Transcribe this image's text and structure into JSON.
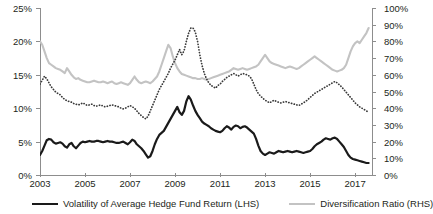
{
  "chart_data": {
    "type": "line",
    "title": "",
    "xlabel": "",
    "ylabel": "",
    "grid": false,
    "legend_position": "bottom",
    "x_ticks": [
      "2003",
      "2005",
      "2007",
      "2009",
      "2011",
      "2013",
      "2015",
      "2017"
    ],
    "x_range": [
      2003,
      2017.75
    ],
    "left_axis": {
      "label": "",
      "ylim": [
        0,
        25
      ],
      "unit": "%",
      "ticks": [
        "0%",
        "5%",
        "10%",
        "15%",
        "20%",
        "25%"
      ],
      "tick_values": [
        0,
        5,
        10,
        15,
        20,
        25
      ]
    },
    "right_axis": {
      "label": "",
      "ylim": [
        0,
        100
      ],
      "unit": "%",
      "ticks": [
        "0%",
        "10%",
        "20%",
        "30%",
        "40%",
        "50%",
        "60%",
        "70%",
        "80%",
        "90%",
        "100%"
      ],
      "tick_values": [
        0,
        10,
        20,
        30,
        40,
        50,
        60,
        70,
        80,
        90,
        100
      ]
    },
    "series": [
      {
        "name": "Volatility of Average Hedge Fund Return (LHS)",
        "axis": "left",
        "style": "solid",
        "color": "#1a1a1a",
        "x": [
          2003.0,
          2003.1,
          2003.2,
          2003.3,
          2003.4,
          2003.5,
          2003.6,
          2003.7,
          2003.8,
          2003.9,
          2004.0,
          2004.1,
          2004.2,
          2004.3,
          2004.4,
          2004.5,
          2004.6,
          2004.7,
          2004.8,
          2004.9,
          2005.0,
          2005.1,
          2005.2,
          2005.3,
          2005.4,
          2005.5,
          2005.6,
          2005.7,
          2005.8,
          2005.9,
          2006.0,
          2006.1,
          2006.2,
          2006.3,
          2006.4,
          2006.5,
          2006.6,
          2006.7,
          2006.8,
          2006.9,
          2007.0,
          2007.1,
          2007.2,
          2007.3,
          2007.4,
          2007.5,
          2007.6,
          2007.7,
          2007.8,
          2007.9,
          2008.0,
          2008.1,
          2008.2,
          2008.3,
          2008.4,
          2008.5,
          2008.6,
          2008.7,
          2008.8,
          2008.9,
          2009.0,
          2009.1,
          2009.2,
          2009.3,
          2009.4,
          2009.5,
          2009.6,
          2009.7,
          2009.8,
          2009.9,
          2010.0,
          2010.1,
          2010.2,
          2010.3,
          2010.4,
          2010.5,
          2010.6,
          2010.7,
          2010.8,
          2010.9,
          2011.0,
          2011.1,
          2011.2,
          2011.3,
          2011.4,
          2011.5,
          2011.6,
          2011.7,
          2011.8,
          2011.9,
          2012.0,
          2012.1,
          2012.2,
          2012.3,
          2012.4,
          2012.5,
          2012.6,
          2012.7,
          2012.8,
          2012.9,
          2013.0,
          2013.1,
          2013.2,
          2013.3,
          2013.4,
          2013.5,
          2013.6,
          2013.7,
          2013.8,
          2013.9,
          2014.0,
          2014.1,
          2014.2,
          2014.3,
          2014.4,
          2014.5,
          2014.6,
          2014.7,
          2014.8,
          2014.9,
          2015.0,
          2015.1,
          2015.2,
          2015.3,
          2015.4,
          2015.5,
          2015.6,
          2015.7,
          2015.8,
          2015.9,
          2016.0,
          2016.1,
          2016.2,
          2016.3,
          2016.4,
          2016.5,
          2016.6,
          2016.7,
          2016.8,
          2016.9,
          2017.0,
          2017.1,
          2017.2,
          2017.3,
          2017.4,
          2017.5,
          2017.6
        ],
        "y": [
          3.0,
          3.6,
          4.4,
          5.2,
          5.4,
          5.3,
          4.9,
          4.7,
          4.8,
          4.9,
          4.7,
          4.3,
          4.1,
          4.6,
          4.8,
          4.3,
          4.0,
          4.4,
          4.8,
          5.0,
          4.9,
          5.0,
          5.1,
          5.0,
          5.0,
          5.1,
          5.1,
          5.0,
          4.9,
          5.0,
          5.1,
          5.0,
          5.0,
          4.9,
          4.8,
          4.8,
          4.9,
          5.0,
          4.8,
          4.6,
          4.9,
          5.3,
          5.1,
          4.6,
          4.3,
          4.0,
          3.6,
          3.1,
          2.6,
          2.8,
          3.6,
          4.6,
          5.4,
          6.0,
          6.3,
          6.6,
          7.2,
          7.8,
          8.4,
          9.0,
          9.6,
          10.2,
          9.4,
          9.0,
          9.6,
          11.0,
          11.8,
          11.3,
          10.4,
          9.6,
          9.0,
          8.5,
          8.0,
          7.7,
          7.5,
          7.3,
          7.0,
          6.8,
          6.6,
          6.5,
          6.4,
          6.6,
          7.0,
          7.3,
          7.1,
          6.8,
          7.2,
          7.4,
          7.3,
          7.0,
          7.2,
          7.3,
          7.1,
          6.8,
          6.5,
          6.2,
          5.4,
          4.4,
          3.6,
          3.2,
          3.0,
          3.2,
          3.4,
          3.3,
          3.2,
          3.4,
          3.6,
          3.5,
          3.4,
          3.5,
          3.6,
          3.5,
          3.4,
          3.5,
          3.6,
          3.5,
          3.4,
          3.3,
          3.4,
          3.5,
          3.6,
          3.9,
          4.3,
          4.6,
          4.8,
          5.0,
          5.3,
          5.5,
          5.4,
          5.3,
          5.5,
          5.6,
          5.4,
          5.0,
          4.6,
          4.2,
          3.6,
          3.0,
          2.6,
          2.4,
          2.3,
          2.2,
          2.1,
          2.0,
          1.9,
          1.8,
          1.8
        ]
      },
      {
        "name": "Diversification Ratio (RHS)",
        "axis": "right",
        "style": "solid",
        "color": "#c3c3c3",
        "x": [
          2003.0,
          2003.1,
          2003.2,
          2003.3,
          2003.4,
          2003.5,
          2003.6,
          2003.7,
          2003.8,
          2003.9,
          2004.0,
          2004.1,
          2004.2,
          2004.3,
          2004.4,
          2004.5,
          2004.6,
          2004.7,
          2004.8,
          2004.9,
          2005.0,
          2005.1,
          2005.2,
          2005.3,
          2005.4,
          2005.5,
          2005.6,
          2005.7,
          2005.8,
          2005.9,
          2006.0,
          2006.1,
          2006.2,
          2006.3,
          2006.4,
          2006.5,
          2006.6,
          2006.7,
          2006.8,
          2006.9,
          2007.0,
          2007.1,
          2007.2,
          2007.3,
          2007.4,
          2007.5,
          2007.6,
          2007.7,
          2007.8,
          2007.9,
          2008.0,
          2008.1,
          2008.2,
          2008.3,
          2008.4,
          2008.5,
          2008.6,
          2008.7,
          2008.8,
          2008.9,
          2009.0,
          2009.1,
          2009.2,
          2009.3,
          2009.4,
          2009.5,
          2009.6,
          2009.7,
          2009.8,
          2009.9,
          2010.0,
          2010.1,
          2010.2,
          2010.3,
          2010.4,
          2010.5,
          2010.6,
          2010.7,
          2010.8,
          2010.9,
          2011.0,
          2011.1,
          2011.2,
          2011.3,
          2011.4,
          2011.5,
          2011.6,
          2011.7,
          2011.8,
          2011.9,
          2012.0,
          2012.1,
          2012.2,
          2012.3,
          2012.4,
          2012.5,
          2012.6,
          2012.7,
          2012.8,
          2012.9,
          2013.0,
          2013.1,
          2013.2,
          2013.3,
          2013.4,
          2013.5,
          2013.6,
          2013.7,
          2013.8,
          2013.9,
          2014.0,
          2014.1,
          2014.2,
          2014.3,
          2014.4,
          2014.5,
          2014.6,
          2014.7,
          2014.8,
          2014.9,
          2015.0,
          2015.1,
          2015.2,
          2015.3,
          2015.4,
          2015.5,
          2015.6,
          2015.7,
          2015.8,
          2015.9,
          2016.0,
          2016.1,
          2016.2,
          2016.3,
          2016.4,
          2016.5,
          2016.6,
          2016.7,
          2016.8,
          2016.9,
          2017.0,
          2017.1,
          2017.2,
          2017.3,
          2017.4,
          2017.5,
          2017.6
        ],
        "y": [
          80.0,
          78.0,
          74.0,
          70.0,
          67.0,
          66.0,
          65.0,
          64.0,
          63.5,
          63.0,
          62.0,
          61.0,
          64.0,
          62.0,
          60.0,
          58.5,
          57.5,
          58.0,
          57.0,
          56.5,
          56.0,
          55.5,
          55.5,
          56.0,
          56.5,
          56.0,
          55.5,
          55.5,
          56.0,
          55.5,
          55.0,
          55.5,
          56.0,
          55.0,
          54.5,
          55.0,
          55.5,
          55.0,
          54.5,
          54.0,
          55.0,
          57.0,
          59.0,
          57.0,
          55.5,
          55.0,
          55.5,
          56.0,
          55.5,
          55.0,
          56.0,
          57.5,
          59.0,
          62.0,
          66.0,
          70.0,
          74.0,
          78.0,
          76.0,
          71.0,
          67.0,
          64.0,
          62.0,
          60.5,
          60.0,
          59.5,
          59.0,
          58.5,
          58.0,
          58.0,
          57.5,
          57.5,
          58.0,
          57.5,
          57.0,
          57.5,
          58.0,
          58.5,
          59.0,
          59.5,
          60.0,
          60.5,
          61.0,
          61.5,
          62.0,
          63.0,
          64.0,
          63.5,
          63.0,
          63.5,
          64.0,
          63.5,
          63.0,
          63.5,
          64.0,
          64.5,
          65.0,
          66.0,
          68.0,
          70.0,
          72.0,
          70.0,
          68.0,
          67.0,
          66.5,
          66.0,
          65.5,
          65.0,
          64.5,
          64.0,
          64.5,
          65.0,
          64.5,
          64.0,
          63.5,
          64.0,
          65.0,
          66.0,
          67.0,
          68.0,
          69.0,
          70.0,
          71.0,
          70.0,
          69.0,
          68.0,
          67.0,
          66.0,
          65.0,
          64.0,
          63.0,
          62.5,
          62.0,
          62.5,
          63.0,
          64.0,
          66.0,
          70.0,
          74.0,
          77.0,
          79.0,
          80.0,
          79.0,
          81.0,
          83.0,
          85.0,
          88.0
        ]
      },
      {
        "name": "",
        "axis": "left",
        "style": "dotted",
        "color": "#3a3a3a",
        "x": [
          2003.0,
          2003.1,
          2003.2,
          2003.3,
          2003.4,
          2003.5,
          2003.6,
          2003.7,
          2003.8,
          2003.9,
          2004.0,
          2004.1,
          2004.2,
          2004.3,
          2004.4,
          2004.5,
          2004.6,
          2004.7,
          2004.8,
          2004.9,
          2005.0,
          2005.1,
          2005.2,
          2005.3,
          2005.4,
          2005.5,
          2005.6,
          2005.7,
          2005.8,
          2005.9,
          2006.0,
          2006.1,
          2006.2,
          2006.3,
          2006.4,
          2006.5,
          2006.6,
          2006.7,
          2006.8,
          2006.9,
          2007.0,
          2007.1,
          2007.2,
          2007.3,
          2007.4,
          2007.5,
          2007.6,
          2007.7,
          2007.8,
          2007.9,
          2008.0,
          2008.1,
          2008.2,
          2008.3,
          2008.4,
          2008.5,
          2008.6,
          2008.7,
          2008.8,
          2008.9,
          2009.0,
          2009.1,
          2009.2,
          2009.3,
          2009.4,
          2009.5,
          2009.6,
          2009.7,
          2009.8,
          2009.9,
          2010.0,
          2010.1,
          2010.2,
          2010.3,
          2010.4,
          2010.5,
          2010.6,
          2010.7,
          2010.8,
          2010.9,
          2011.0,
          2011.1,
          2011.2,
          2011.3,
          2011.4,
          2011.5,
          2011.6,
          2011.7,
          2011.8,
          2011.9,
          2012.0,
          2012.1,
          2012.2,
          2012.3,
          2012.4,
          2012.5,
          2012.6,
          2012.7,
          2012.8,
          2012.9,
          2013.0,
          2013.1,
          2013.2,
          2013.3,
          2013.4,
          2013.5,
          2013.6,
          2013.7,
          2013.8,
          2013.9,
          2014.0,
          2014.1,
          2014.2,
          2014.3,
          2014.4,
          2014.5,
          2014.6,
          2014.7,
          2014.8,
          2014.9,
          2015.0,
          2015.1,
          2015.2,
          2015.3,
          2015.4,
          2015.5,
          2015.6,
          2015.7,
          2015.8,
          2015.9,
          2016.0,
          2016.1,
          2016.2,
          2016.3,
          2016.4,
          2016.5,
          2016.6,
          2016.7,
          2016.8,
          2016.9,
          2017.0,
          2017.1,
          2017.2,
          2017.3,
          2017.4,
          2017.5,
          2017.6
        ],
        "y": [
          13.6,
          14.2,
          14.8,
          14.4,
          13.8,
          13.2,
          12.8,
          12.4,
          12.2,
          12.0,
          11.6,
          11.3,
          11.1,
          11.0,
          10.9,
          10.7,
          10.6,
          10.5,
          10.6,
          10.8,
          10.6,
          10.4,
          10.5,
          10.6,
          10.4,
          10.3,
          10.4,
          10.5,
          10.3,
          10.2,
          10.3,
          10.4,
          10.5,
          10.4,
          10.3,
          10.2,
          10.0,
          9.9,
          10.0,
          10.2,
          10.4,
          10.2,
          10.0,
          9.6,
          9.2,
          8.9,
          8.6,
          8.4,
          8.8,
          9.6,
          10.4,
          11.2,
          12.0,
          12.8,
          13.4,
          14.0,
          14.6,
          15.2,
          16.0,
          16.6,
          17.2,
          18.0,
          18.8,
          18.0,
          18.6,
          20.0,
          21.2,
          22.0,
          22.0,
          21.4,
          20.0,
          18.0,
          16.4,
          15.2,
          14.4,
          13.8,
          13.4,
          13.2,
          13.0,
          13.4,
          13.6,
          14.0,
          14.3,
          14.6,
          14.8,
          15.0,
          15.2,
          15.0,
          14.8,
          15.0,
          15.2,
          15.1,
          15.0,
          14.8,
          14.4,
          13.6,
          12.8,
          12.2,
          11.8,
          11.5,
          11.2,
          11.0,
          10.8,
          11.0,
          11.2,
          11.0,
          10.9,
          10.8,
          10.9,
          11.0,
          10.9,
          10.8,
          10.7,
          10.6,
          10.5,
          10.4,
          10.6,
          10.8,
          11.0,
          11.3,
          11.6,
          11.9,
          12.2,
          12.4,
          12.6,
          12.8,
          13.0,
          13.2,
          13.4,
          13.6,
          13.8,
          14.0,
          13.8,
          13.5,
          13.2,
          12.8,
          12.4,
          12.0,
          11.6,
          11.2,
          10.8,
          10.5,
          10.2,
          10.0,
          9.8,
          9.6,
          9.4
        ]
      }
    ]
  },
  "legend": {
    "items": [
      {
        "label": "Volatility of Average Hedge Fund Return (LHS)",
        "style": "solid",
        "color": "#1a1a1a"
      },
      {
        "label": "Diversification Ratio (RHS)",
        "style": "gray",
        "color": "#c3c3c3"
      }
    ]
  }
}
